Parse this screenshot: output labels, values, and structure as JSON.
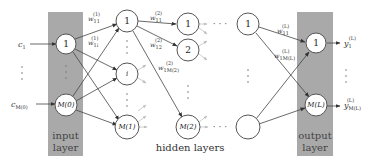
{
  "diagram": {
    "input_layer": {
      "band_label_line1": "input",
      "band_label_line2": "layer",
      "inputs": [
        "c",
        "c"
      ],
      "input_subs": [
        "1",
        "M(0)"
      ],
      "nodes": [
        "1",
        "M(0)"
      ]
    },
    "hidden_layers": {
      "caption": "hidden layers",
      "layer1": {
        "nodes": [
          "1",
          "i",
          "M(1)"
        ]
      },
      "layer2": {
        "nodes": [
          "1",
          "2",
          "M(2)"
        ]
      },
      "layerLast": {
        "nodes": [
          "1",
          ""
        ]
      },
      "ellipsis": "· · ·"
    },
    "output_layer": {
      "band_label_line1": "output",
      "band_label_line2": "layer",
      "nodes": [
        "1",
        "M(L)"
      ],
      "outputs": [
        "y",
        "y"
      ],
      "output_subs": [
        "1",
        "M(L)"
      ],
      "output_sup": "(L)"
    },
    "weights": {
      "w11_1": {
        "base": "w",
        "sup": "(1)",
        "sub": "11"
      },
      "w1i_1": {
        "base": "w",
        "sup": "(1)",
        "sub": "1i"
      },
      "w11_2": {
        "base": "w",
        "sup": "(2)",
        "sub": "11"
      },
      "w12_2": {
        "base": "w",
        "sup": "(2)",
        "sub": "12"
      },
      "w1M2_2": {
        "base": "w",
        "sup": "(2)",
        "sub": "1M(2)"
      },
      "w11_L": {
        "base": "w",
        "sup": "(L)",
        "sub": "11"
      },
      "w1ML_L": {
        "base": "w",
        "sup": "(L)",
        "sub": "1M(L)"
      }
    },
    "colors": {
      "band": "#a9a9a9",
      "node_fill": "#ffffff",
      "node_stroke": "#555555",
      "edge": "#444444",
      "edge_faint": "#b8b8b8"
    }
  }
}
